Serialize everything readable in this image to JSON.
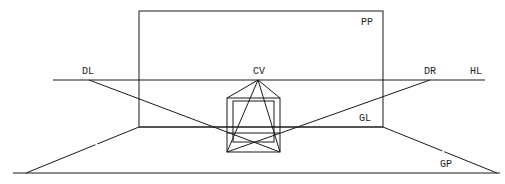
{
  "diagram": {
    "labels": {
      "picture_plane": "PP",
      "horizon_line": "HL",
      "center_of_vision": "CV",
      "distance_left": "DL",
      "distance_right": "DR",
      "ground_line": "GL",
      "ground_plane": "GP"
    },
    "colors": {
      "line": "#1a1a1a",
      "background": "#ffffff"
    }
  }
}
